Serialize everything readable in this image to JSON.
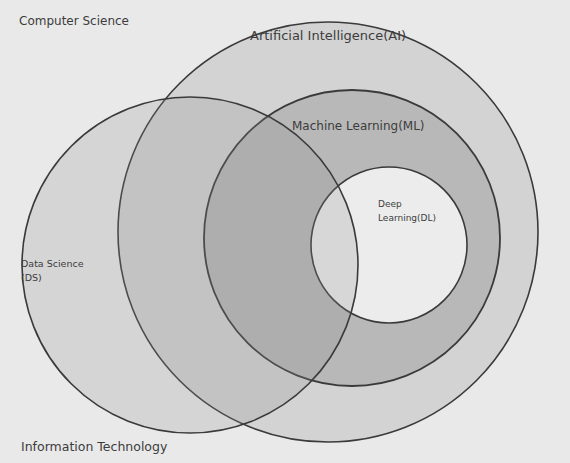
{
  "diagram": {
    "type": "venn",
    "regions": {
      "computer_science": "Computer Science",
      "information_technology": "Information Technology"
    },
    "circles": {
      "ai": {
        "label": "Artificial Intelligence(AI)",
        "fill": "#d2d2d2"
      },
      "ml": {
        "label": "Machine Learning(ML)",
        "fill": "#b9b9b9"
      },
      "dl": {
        "label_line1": "Deep",
        "label_line2": "Learning(DL)",
        "fill": "#ececec"
      },
      "ds": {
        "label_line1": "Data Science",
        "label_line2": "(DS)",
        "fill": "#bdbdbd"
      }
    },
    "colors": {
      "background": "#e9e9e9",
      "stroke": "#3a3a3a",
      "text": "#3c3c3c"
    }
  }
}
